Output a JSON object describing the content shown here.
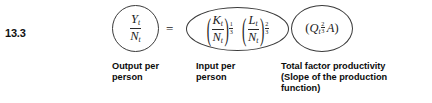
{
  "equation": {
    "number_label": "13.3",
    "equals_sign": "=",
    "left_side": {
      "numerator": "Y",
      "numerator_sub": "t",
      "denominator": "N",
      "denominator_sub": "t",
      "caption": "Output per\nperson"
    },
    "input_term": {
      "factor_1": {
        "open_paren": "(",
        "close_paren": ")",
        "numerator": "K",
        "numerator_sub": "t",
        "denominator": "N",
        "denominator_sub": "t",
        "exponent_num": "1",
        "exponent_den": "3"
      },
      "factor_2": {
        "open_paren": "(",
        "close_paren": ")",
        "numerator": "L",
        "numerator_sub": "t",
        "denominator": "N",
        "denominator_sub": "t",
        "exponent_num": "2",
        "exponent_den": "3"
      },
      "caption": "Input per\nperson"
    },
    "tfp_term": {
      "open_paren": "(",
      "close_paren": ")",
      "variable": "Q",
      "variable_sub": "t",
      "exponent_num": "2",
      "exponent_den": "3",
      "multiplier": "A",
      "caption": "Total factor productivity\n(Slope of the production\nfunction)"
    }
  },
  "style": {
    "background": "#ffffff",
    "ink": "#1a1a1a",
    "oval_stroke": "#3a3a3a"
  }
}
